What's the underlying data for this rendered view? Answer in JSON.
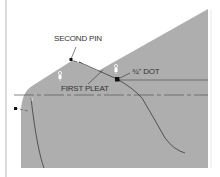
{
  "labels": {
    "second_pin": "SECOND PIN",
    "first_pleat": "FIRST PLEAT",
    "dot": "¾\" DOT"
  },
  "colors": {
    "fabric": "#aeaeae",
    "background": "#ffffff",
    "line": "#3a3a3a",
    "border": "#d0d0d0"
  }
}
